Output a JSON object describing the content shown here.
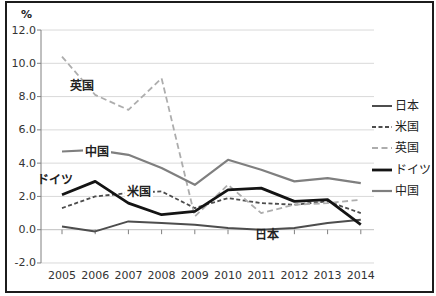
{
  "chart_data": {
    "type": "line",
    "title": "",
    "unit_label": "%",
    "x": [
      2005,
      2006,
      2007,
      2008,
      2009,
      2010,
      2011,
      2012,
      2013,
      2014
    ],
    "x_labels": [
      "2005",
      "2006",
      "2007",
      "2008",
      "2009",
      "2010",
      "2011",
      "2012",
      "2013",
      "2014"
    ],
    "ylim": [
      -2.0,
      12.0
    ],
    "ytick_step": 2.0,
    "ytick_values": [
      12,
      10,
      8,
      6,
      4,
      2,
      0,
      -2
    ],
    "ytick_labels": [
      "12.0",
      "10.0",
      "8.0",
      "6.0",
      "4.0",
      "2.0",
      "0.0",
      "-2.0"
    ],
    "grid": true,
    "legend_position": "right",
    "series": [
      {
        "id": "japan",
        "name": "日本",
        "color": "#4d4d4d",
        "style": "solid",
        "dash": "",
        "width": 2,
        "values": [
          0.2,
          -0.1,
          0.5,
          0.4,
          0.3,
          0.1,
          0.0,
          0.1,
          0.4,
          0.6
        ]
      },
      {
        "id": "us",
        "name": "米国",
        "color": "#4d4d4d",
        "style": "dashed",
        "dash": "4 2.5",
        "width": 1.8,
        "values": [
          1.3,
          2.0,
          2.2,
          2.3,
          1.3,
          1.9,
          1.6,
          1.5,
          1.7,
          1.0
        ]
      },
      {
        "id": "uk",
        "name": "英国",
        "color": "#adadad",
        "style": "dashed",
        "dash": "6 3.5",
        "width": 1.8,
        "values": [
          10.4,
          8.1,
          7.2,
          9.1,
          0.8,
          2.7,
          1.0,
          1.5,
          1.6,
          1.8
        ]
      },
      {
        "id": "germany",
        "name": "ドイツ",
        "color": "#141414",
        "style": "solid",
        "dash": "",
        "width": 2.8,
        "values": [
          2.1,
          2.9,
          1.6,
          0.9,
          1.1,
          2.4,
          2.5,
          1.7,
          1.8,
          0.3
        ]
      },
      {
        "id": "china",
        "name": "中国",
        "color": "#7f7f7f",
        "style": "solid",
        "dash": "",
        "width": 2.2,
        "values": [
          4.7,
          4.8,
          4.5,
          3.7,
          2.7,
          4.2,
          3.6,
          2.9,
          3.1,
          2.8
        ]
      }
    ],
    "inline_labels": [
      {
        "id": "uk",
        "text": "英国"
      },
      {
        "id": "china",
        "text": "中国"
      },
      {
        "id": "germany",
        "text": "ドイツ"
      },
      {
        "id": "us",
        "text": "米国"
      },
      {
        "id": "japan",
        "text": "日本"
      }
    ],
    "colors": {
      "grid": "#d9d9d9",
      "zero_line": "#bfbfbf",
      "axis": "#808080",
      "tick_text": "#333333",
      "background": "#ffffff",
      "frame": "#1c1c1c"
    }
  }
}
